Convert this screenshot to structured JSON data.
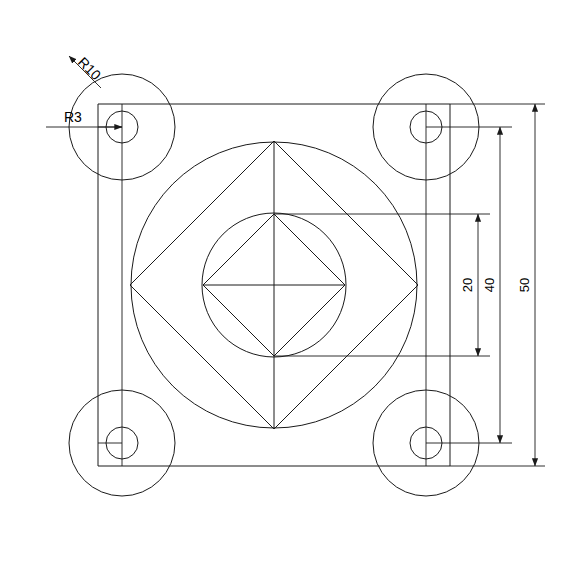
{
  "drawing": {
    "title": "Plate with circular bosses, concentric circles and rotated squares",
    "units": "mm",
    "background_color": "#ffffff",
    "line_color": "#1a1a1a",
    "text_color": "#000000",
    "annotations": {
      "radius_outer_corner": "R10",
      "radius_inner_corner": "R3"
    },
    "dimensions": [
      {
        "id": "dim-20",
        "label": "20",
        "value": 20
      },
      {
        "id": "dim-40",
        "label": "40",
        "value": 40
      },
      {
        "id": "dim-50",
        "label": "50",
        "value": 50
      }
    ],
    "geometry": {
      "plate_square": {
        "label": "50",
        "side": 50,
        "x1": 98,
        "y1": 104,
        "x2": 450,
        "y2": 466
      },
      "center": {
        "x": 274,
        "y": 285
      },
      "scale_px_per_unit": 7.04,
      "corner_bosses": [
        {
          "name": "top-left",
          "cx": 122,
          "cy": 127,
          "r_outer": 53,
          "r_inner": 16
        },
        {
          "name": "top-right",
          "cx": 426,
          "cy": 127,
          "r_outer": 53,
          "r_inner": 16
        },
        {
          "name": "bottom-left",
          "cx": 122,
          "cy": 443,
          "r_outer": 53,
          "r_inner": 16
        },
        {
          "name": "bottom-right",
          "cx": 426,
          "cy": 443,
          "r_outer": 53,
          "r_inner": 16
        }
      ],
      "center_circle_outer_r": 143,
      "center_circle_inner_r": 72,
      "outer_diamond_half": 144,
      "inner_diamond_half": 71
    }
  }
}
